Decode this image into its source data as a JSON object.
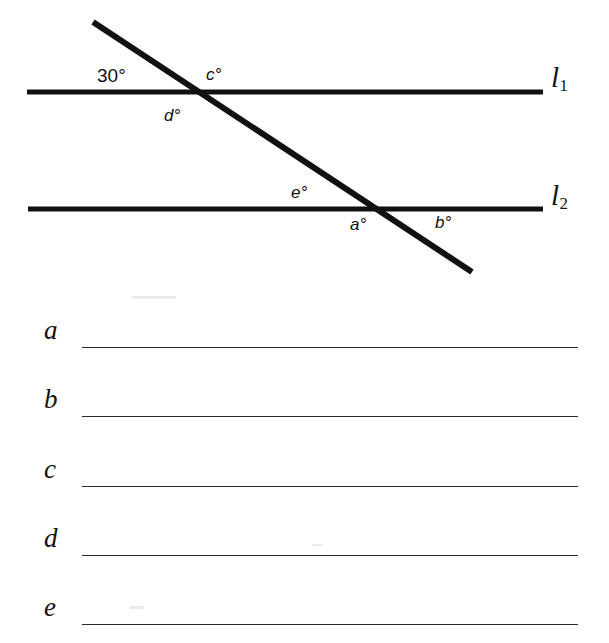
{
  "page": {
    "width": 609,
    "height": 643,
    "background": "#ffffff",
    "ink_color": "#111111"
  },
  "diagram": {
    "type": "geometry-figure",
    "lines": [
      {
        "name": "l1",
        "label": "l",
        "subscript": "1",
        "kind": "parallel-line",
        "x1": 27,
        "y1": 92,
        "x2": 543,
        "y2": 92,
        "stroke_width": 5
      },
      {
        "name": "l2",
        "label": "l",
        "subscript": "2",
        "kind": "parallel-line",
        "x1": 28,
        "y1": 209,
        "x2": 543,
        "y2": 209,
        "stroke_width": 5
      },
      {
        "name": "transversal",
        "label": "",
        "subscript": "",
        "kind": "transversal",
        "x1": 93,
        "y1": 22,
        "x2": 472,
        "y2": 272,
        "stroke_width": 6
      }
    ],
    "intersections": [
      {
        "name": "upper",
        "line": "l1",
        "x": 196,
        "y": 92
      },
      {
        "name": "lower",
        "line": "l2",
        "x": 377,
        "y": 209
      }
    ],
    "angle_labels": [
      {
        "id": "given",
        "text": "30°",
        "style": "upright",
        "x": 97,
        "y": 66,
        "at": "upper",
        "position": "upper-left"
      },
      {
        "id": "c",
        "text": "c°",
        "style": "italic",
        "x": 206,
        "y": 66,
        "at": "upper",
        "position": "upper-right"
      },
      {
        "id": "d",
        "text": "d°",
        "style": "italic",
        "x": 164,
        "y": 107,
        "at": "upper",
        "position": "lower-left"
      },
      {
        "id": "e",
        "text": "e°",
        "style": "italic",
        "x": 291,
        "y": 184,
        "at": "lower",
        "position": "upper-left"
      },
      {
        "id": "a",
        "text": "a°",
        "style": "italic",
        "x": 350,
        "y": 216,
        "at": "lower",
        "position": "lower-left"
      },
      {
        "id": "b",
        "text": "b°",
        "style": "italic",
        "x": 435,
        "y": 214,
        "at": "lower",
        "position": "lower-right"
      }
    ]
  },
  "answers": {
    "rule_left": 82,
    "rule_right": 578,
    "rows": [
      {
        "letter": "a",
        "value": "",
        "rule_y": 347
      },
      {
        "letter": "b",
        "value": "",
        "rule_y": 416
      },
      {
        "letter": "c",
        "value": "",
        "rule_y": 486
      },
      {
        "letter": "d",
        "value": "",
        "rule_y": 555
      },
      {
        "letter": "e",
        "value": "",
        "rule_y": 624
      }
    ]
  }
}
